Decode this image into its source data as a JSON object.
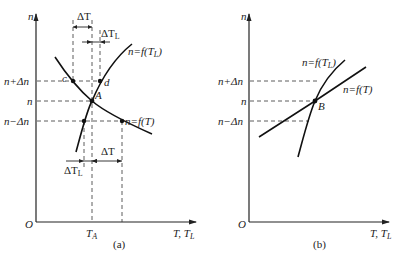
{
  "panels": [
    {
      "id": "a",
      "caption": "(a)",
      "y_axis_label": "n",
      "x_axis_label": "T, T",
      "x_axis_label_sub": "L",
      "origin_label": "O",
      "y_ticks": [
        "n+Δn",
        "n",
        "n−Δn"
      ],
      "x_tick": "T",
      "x_tick_sub": "A",
      "curves": [
        {
          "label": "n=f(T",
          "label_sub": "L",
          "label_close": ")"
        },
        {
          "label": "n=f(T)"
        }
      ],
      "points": [
        "c",
        "d",
        "A"
      ],
      "dimensions": {
        "top_dT": "ΔT",
        "top_dTL": "ΔT",
        "top_dTL_sub": "L",
        "bottom_dTL": "ΔT",
        "bottom_dTL_sub": "L",
        "bottom_dT": "ΔT"
      }
    },
    {
      "id": "b",
      "caption": "(b)",
      "y_axis_label": "n",
      "x_axis_label": "T, T",
      "x_axis_label_sub": "L",
      "origin_label": "O",
      "y_ticks": [
        "n+Δn",
        "n",
        "n−Δn"
      ],
      "curves": [
        {
          "label": "n=f(T",
          "label_sub": "L",
          "label_close": ")"
        },
        {
          "label": "n=f(T)"
        }
      ],
      "points": [
        "B"
      ]
    }
  ]
}
